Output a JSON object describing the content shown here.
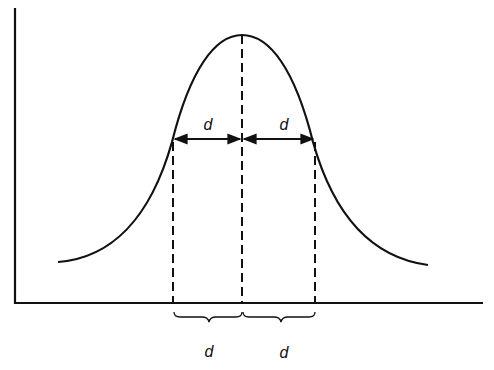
{
  "diagram": {
    "type": "bell-curve-distance",
    "labels": {
      "upper_left": "d",
      "upper_right": "d",
      "lower_left": "d",
      "lower_right": "d"
    },
    "colors": {
      "stroke": "#111111",
      "background": "#ffffff"
    }
  }
}
